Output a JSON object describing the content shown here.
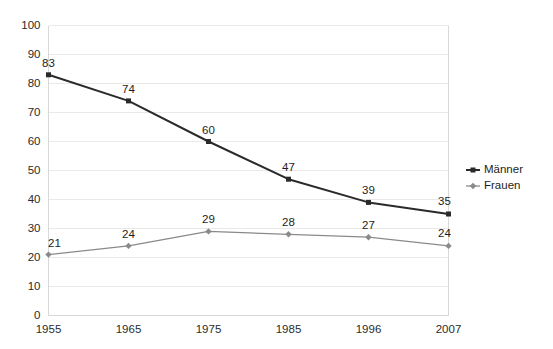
{
  "chart_data": {
    "type": "line",
    "title": "",
    "subtitle": "",
    "xlabel": "",
    "ylabel": "",
    "categories": [
      "1955",
      "1965",
      "1975",
      "1985",
      "1996",
      "2007"
    ],
    "ylim": [
      0,
      100
    ],
    "yticks": [
      0,
      10,
      20,
      30,
      40,
      50,
      60,
      70,
      80,
      90,
      100
    ],
    "ytick_labels": [
      "0",
      "10",
      "20",
      "30",
      "40",
      "50",
      "60",
      "70",
      "80",
      "90",
      "100"
    ],
    "grid": true,
    "legend_position": "right",
    "series": [
      {
        "name": "Männer",
        "values": [
          83,
          74,
          60,
          47,
          39,
          35
        ],
        "labels": [
          "83",
          "74",
          "60",
          "47",
          "39",
          "35"
        ],
        "color": "#2a2a2a",
        "marker": "square"
      },
      {
        "name": "Frauen",
        "values": [
          21,
          24,
          29,
          28,
          27,
          24
        ],
        "labels": [
          "21",
          "24",
          "29",
          "28",
          "27",
          "24"
        ],
        "color": "#8a8a8a",
        "marker": "diamond"
      }
    ]
  },
  "legend": {
    "items": [
      {
        "label": "Männer",
        "color": "#2a2a2a",
        "marker": "square"
      },
      {
        "label": "Frauen",
        "color": "#8a8a8a",
        "marker": "diamond"
      }
    ]
  },
  "axes": {
    "grid_color": "#e9e9e9",
    "axis_color": "#d8d8d8",
    "background": "#ffffff"
  }
}
